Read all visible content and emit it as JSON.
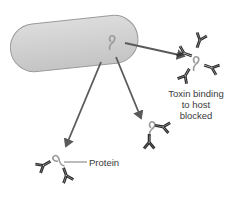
{
  "diagram": {
    "labels": {
      "toxin_line1": "Toxin binding",
      "toxin_line2": "to host",
      "toxin_line3": "blocked",
      "protein": "Protein"
    },
    "colors": {
      "cell_fill": "#cfcfcf",
      "cell_stroke": "#9a9a9a",
      "arrow": "#5a5a5a",
      "antibody": "#2f2f2f",
      "protein": "#9a9a9a",
      "text": "#3a3a3a"
    }
  }
}
